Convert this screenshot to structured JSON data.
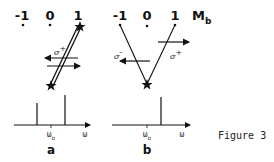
{
  "figure": {
    "caption": "Figure 3",
    "quantum_number_label": "M",
    "quantum_number_sub": "b",
    "panels": [
      {
        "id": "a",
        "label": "a",
        "levels": [
          "-1",
          "0",
          "1"
        ],
        "transitions": [
          {
            "label": "σ",
            "sign": "+",
            "arrows": [
              "left",
              "right"
            ]
          }
        ],
        "spectrum": {
          "xlabel": "ω",
          "center_label": "ω",
          "center_sub": "o",
          "lines": [
            "left-short",
            "right-tall"
          ]
        }
      },
      {
        "id": "b",
        "label": "b",
        "levels": [
          "-1",
          "0",
          "1"
        ],
        "transitions": [
          {
            "label": "σ",
            "sign": "-",
            "arrow": "left"
          },
          {
            "label": "σ",
            "sign": "+",
            "arrow": "right"
          }
        ],
        "spectrum": {
          "xlabel": "ω",
          "center_label": "ω",
          "center_sub": "o",
          "lines": [
            "right-tall"
          ]
        }
      }
    ]
  }
}
